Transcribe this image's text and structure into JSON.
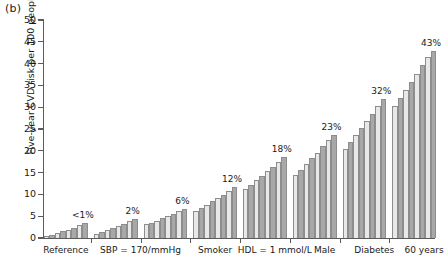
{
  "panel": {
    "label": "(b)"
  },
  "chart_data": {
    "type": "bar",
    "title": "",
    "subtitle": "",
    "xlabel": "",
    "ylabel": "Five-year CVD risk per 100 people",
    "ylim": [
      0,
      50
    ],
    "yticks": [
      0,
      5,
      10,
      15,
      20,
      25,
      30,
      35,
      40,
      45,
      50
    ],
    "ytick_labels": [
      "0",
      "5",
      "10",
      "15",
      "20",
      "25",
      "30",
      "35",
      "40",
      "45",
      "50"
    ],
    "grid": false,
    "legend": null,
    "bars_per_group": 8,
    "bar_colors": {
      "light": "#e8e8e8",
      "dark": "#a8a8a8"
    },
    "categories": [
      "Reference",
      "SBP = 170/mmHg",
      "Smoker",
      "HDL = 1 mmol/L",
      "Male",
      "Diabetes",
      "60 years"
    ],
    "group_annotations": [
      "<1%",
      "2%",
      "6%",
      "12%",
      "18%",
      "23%",
      "32%",
      "43%"
    ],
    "groups": [
      {
        "label": "Reference",
        "annotation": "<1%",
        "values": [
          0.4,
          0.7,
          1.1,
          1.5,
          1.9,
          2.4,
          2.9,
          3.4
        ]
      },
      {
        "label": "",
        "annotation": "2%",
        "values": [
          0.9,
          1.3,
          1.8,
          2.3,
          2.8,
          3.3,
          3.9,
          4.3
        ]
      },
      {
        "label": "SBP = 170/mmHg",
        "annotation": "6%",
        "values": [
          3.1,
          3.5,
          4.0,
          4.5,
          5.0,
          5.5,
          6.1,
          6.6
        ]
      },
      {
        "label": "Smoker",
        "annotation": "12%",
        "values": [
          6.2,
          6.9,
          7.6,
          8.4,
          9.1,
          9.9,
          10.7,
          11.6
        ]
      },
      {
        "label": "HDL = 1 mmol/L",
        "annotation": "18%",
        "values": [
          11.2,
          12.2,
          13.2,
          14.2,
          15.3,
          16.4,
          17.5,
          18.5
        ]
      },
      {
        "label": "Male",
        "annotation": "23%",
        "values": [
          14.5,
          15.7,
          17.0,
          18.3,
          19.6,
          21.0,
          22.4,
          23.6
        ]
      },
      {
        "label": "Diabetes",
        "annotation": "32%",
        "values": [
          20.5,
          22.0,
          23.6,
          25.2,
          26.8,
          28.5,
          30.2,
          31.8
        ]
      },
      {
        "label": "60 years",
        "annotation": "43%",
        "values": [
          30.2,
          32.0,
          33.9,
          35.8,
          37.7,
          39.6,
          41.5,
          43.0
        ]
      }
    ]
  }
}
